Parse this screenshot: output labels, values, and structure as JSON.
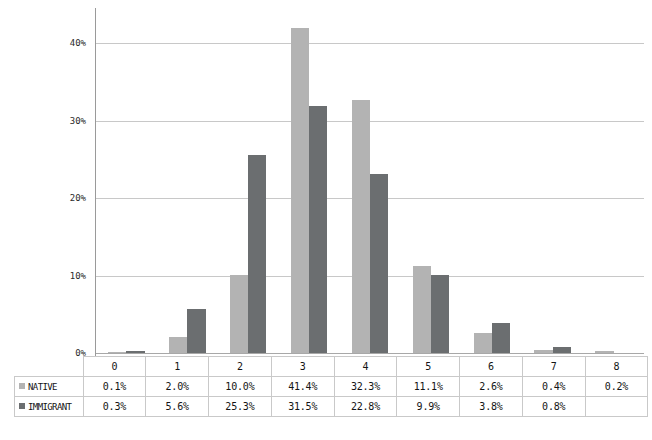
{
  "chart_data": {
    "type": "bar",
    "title": "",
    "subtitle": "",
    "xlabel": "",
    "ylabel": "",
    "categories": [
      "0",
      "1",
      "2",
      "3",
      "4",
      "5",
      "6",
      "7",
      "8"
    ],
    "series": [
      {
        "name": "NATIVE",
        "color": "#b3b3b3",
        "values": [
          0.1,
          2.0,
          10.0,
          41.4,
          32.3,
          11.1,
          2.6,
          0.4,
          0.2
        ],
        "labels": [
          "0.1%",
          "2.0%",
          "10.0%",
          "41.4%",
          "32.3%",
          "11.1%",
          "2.6%",
          "0.4%",
          "0.2%"
        ]
      },
      {
        "name": "IMMIGRANT",
        "color": "#6b6e70",
        "values": [
          0.3,
          5.6,
          25.3,
          31.5,
          22.8,
          9.9,
          3.8,
          0.8,
          null
        ],
        "labels": [
          "0.3%",
          "5.6%",
          "25.3%",
          "31.5%",
          "22.8%",
          "9.9%",
          "3.8%",
          "0.8%",
          ""
        ]
      }
    ],
    "ylim": [
      0,
      44
    ],
    "yticks": [
      0,
      10,
      20,
      30,
      40
    ],
    "ytick_labels": [
      "0%",
      "10%",
      "20%",
      "30%",
      "40%"
    ],
    "grid": true,
    "legend_position": "data-table-left",
    "has_data_table": true
  },
  "axis": {
    "tick_0": "0%",
    "tick_10": "10%",
    "tick_20": "20%",
    "tick_30": "30%",
    "tick_40": "40%"
  },
  "table": {
    "header_row": [
      "0",
      "1",
      "2",
      "3",
      "4",
      "5",
      "6",
      "7",
      "8"
    ],
    "rows": [
      {
        "label": "NATIVE",
        "swatch_color": "#b3b3b3",
        "cells": [
          "0.1%",
          "2.0%",
          "10.0%",
          "41.4%",
          "32.3%",
          "11.1%",
          "2.6%",
          "0.4%",
          "0.2%"
        ]
      },
      {
        "label": "IMMIGRANT",
        "swatch_color": "#6b6e70",
        "cells": [
          "0.3%",
          "5.6%",
          "25.3%",
          "31.5%",
          "22.8%",
          "9.9%",
          "3.8%",
          "0.8%",
          ""
        ]
      }
    ]
  },
  "colors": {
    "native": "#b3b3b3",
    "immigrant": "#6b6e70",
    "gridline": "#c8c8c8",
    "axis": "#9a9a9a",
    "table_border": "#c9c9c9",
    "background": "#ffffff"
  }
}
